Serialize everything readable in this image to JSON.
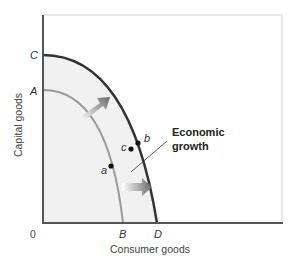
{
  "diagram": {
    "x_axis_label": "Consumer goods",
    "y_axis_label": "Capital goods",
    "origin_label": "0",
    "y_intercepts": [
      "C",
      "A"
    ],
    "x_intercepts": [
      "B",
      "D"
    ],
    "curves": [
      {
        "name": "original-ppc",
        "from": "A",
        "to": "B",
        "color": "#9a9a9a"
      },
      {
        "name": "new-ppc",
        "from": "C",
        "to": "D",
        "color": "#333333"
      }
    ],
    "points": [
      "a",
      "b",
      "c"
    ],
    "annotation": {
      "line1": "Economic",
      "line2": "growth"
    },
    "colors": {
      "fill": "#f2f2f2",
      "axis": "#555555",
      "arrow": "#777777"
    }
  }
}
